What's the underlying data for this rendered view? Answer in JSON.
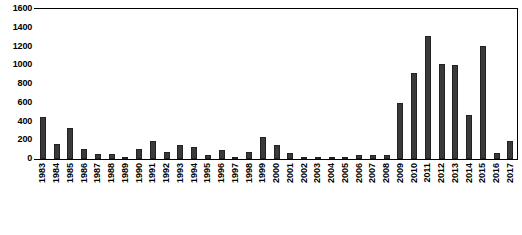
{
  "chart_data": {
    "type": "bar",
    "title": "",
    "subtitle": "",
    "xlabel": "",
    "ylabel": "",
    "ylim": [
      0,
      1600
    ],
    "ytick_labels": [
      "1600",
      "1400",
      "1200",
      "1000",
      "800",
      "600",
      "400",
      "200",
      "0"
    ],
    "ytick_values": [
      1600,
      1400,
      1200,
      1000,
      800,
      600,
      400,
      200,
      0
    ],
    "grid": false,
    "legend": null,
    "legend_position": "none",
    "bar_color": "#3a3a3a",
    "categories": [
      "1983",
      "1984",
      "1985",
      "1986",
      "1987",
      "1988",
      "1989",
      "1990",
      "1991",
      "1992",
      "1993",
      "1994",
      "1995",
      "1996",
      "1997",
      "1998",
      "1999",
      "2000",
      "2001",
      "2002",
      "2003",
      "2004",
      "2005",
      "2006",
      "2007",
      "2008",
      "2009",
      "2010",
      "2011",
      "2012",
      "2013",
      "2014",
      "2015",
      "2016",
      "2017"
    ],
    "values": [
      450,
      165,
      330,
      110,
      55,
      55,
      20,
      110,
      190,
      70,
      150,
      130,
      45,
      95,
      20,
      80,
      230,
      150,
      60,
      25,
      20,
      20,
      25,
      40,
      40,
      45,
      600,
      920,
      1310,
      1010,
      1005,
      470,
      1210,
      65,
      190
    ]
  }
}
